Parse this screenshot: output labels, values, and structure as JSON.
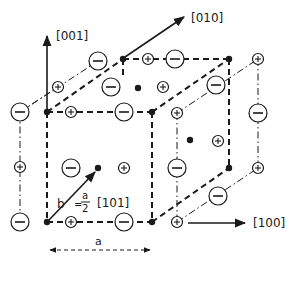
{
  "figure": {
    "type": "crystal-structure-diagram",
    "axes": [
      {
        "id": "z",
        "label": "[001]"
      },
      {
        "id": "y",
        "label": "[010]"
      },
      {
        "id": "x",
        "label": "[100]"
      }
    ],
    "burgers_vector": {
      "symbol": "b",
      "equals": "=",
      "numerator": "a",
      "denominator": "2",
      "direction": "[101]"
    },
    "lattice_parameter": {
      "label": "a"
    },
    "ion_symbols": {
      "negative": "−",
      "positive": "+"
    },
    "ion_types": {
      "negative": "anion (⊖)",
      "positive": "cation (⊕)",
      "neutral": "lattice site (•)"
    },
    "colors": {
      "ink": "#1a1a1a",
      "background": "#ffffff"
    }
  }
}
